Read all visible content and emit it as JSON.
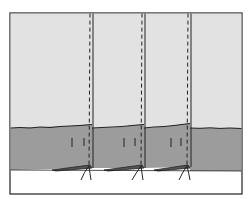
{
  "diagram": {
    "colors": {
      "upper_panel": "#e2e2e2",
      "lower_band": "#9c9c9c",
      "bottom": "#ffffff",
      "outline": "#222222"
    },
    "seams_x": [
      90,
      142,
      190
    ]
  }
}
